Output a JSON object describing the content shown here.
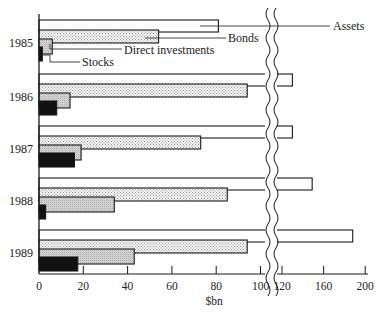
{
  "chart_data": {
    "type": "bar",
    "orientation": "horizontal",
    "title": "",
    "xlabel": "$bn",
    "ylabel": "",
    "categories": [
      "1985",
      "1986",
      "1987",
      "1988",
      "1989"
    ],
    "series": [
      {
        "name": "Assets",
        "fill": "white",
        "values": [
          81,
          130,
          130,
          149,
          188
        ]
      },
      {
        "name": "Bonds",
        "fill": "dotted",
        "values": [
          54,
          94,
          73,
          85,
          94
        ]
      },
      {
        "name": "Direct investments",
        "fill": "gray",
        "values": [
          6,
          14,
          19,
          34,
          43
        ]
      },
      {
        "name": "Stocks",
        "fill": "black",
        "values": [
          1.5,
          8,
          16,
          3,
          17.5
        ]
      }
    ],
    "x_ticks": [
      "0",
      "20",
      "40",
      "60",
      "80",
      "100",
      "120",
      "160",
      "200"
    ],
    "axis_break": {
      "from": 105,
      "to": 115
    },
    "xlim": [
      0,
      200
    ],
    "legend": "leader-line labels on 1985 group",
    "grid": false
  },
  "labels": {
    "assets": "Assets",
    "bonds": "Bonds",
    "direct": "Direct investments",
    "stocks": "Stocks",
    "xlabel": "$bn"
  },
  "colors": {
    "assets": "#ffffff",
    "bonds": "#e6e6e6",
    "direct": "#c8c8c8",
    "stocks": "#111111",
    "stroke": "#1a1a1a"
  }
}
